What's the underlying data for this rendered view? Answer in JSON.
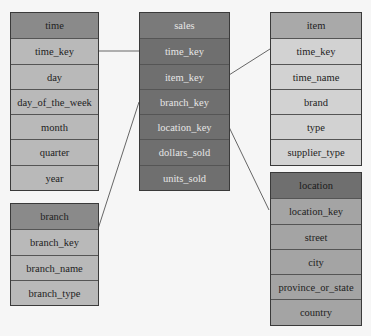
{
  "diagram": {
    "type": "star-schema",
    "tables": {
      "time": {
        "name": "time",
        "fields": [
          "time_key",
          "day",
          "day_of_the_week",
          "month",
          "quarter",
          "year"
        ]
      },
      "branch": {
        "name": "branch",
        "fields": [
          "branch_key",
          "branch_name",
          "branch_type"
        ]
      },
      "sales": {
        "name": "sales",
        "fields": [
          "time_key",
          "item_key",
          "branch_key",
          "location_key",
          "dollars_sold",
          "units_sold"
        ]
      },
      "item": {
        "name": "item",
        "fields": [
          "time_key",
          "time_name",
          "brand",
          "type",
          "supplier_type"
        ]
      },
      "location": {
        "name": "location",
        "fields": [
          "location_key",
          "street",
          "city",
          "province_or_state",
          "country"
        ]
      }
    },
    "relationships": [
      {
        "from": "sales.time_key",
        "to": "time.time_key"
      },
      {
        "from": "sales.branch_key",
        "to": "branch.branch_key"
      },
      {
        "from": "sales.item_key",
        "to": "item.time_key"
      },
      {
        "from": "sales.location_key",
        "to": "location.location_key"
      }
    ]
  }
}
